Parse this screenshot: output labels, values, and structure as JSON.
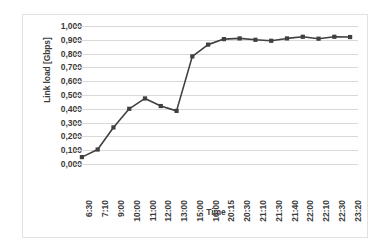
{
  "chart_data": {
    "type": "line",
    "title": "",
    "xlabel": "Time",
    "ylabel": "Link load [Gbps]",
    "ylim": [
      0,
      1.0
    ],
    "ytick_step": 0.1,
    "grid": true,
    "legend": false,
    "decimal_separator": ",",
    "marker": "square",
    "series_color": "#404040",
    "gridline_color": "#d9d9d9",
    "text_color": "#3b3b3b",
    "categories": [
      "6:30",
      "7:10",
      "9:00",
      "10:00",
      "11:00",
      "12:00",
      "13:00",
      "15:00",
      "16:00",
      "20:15",
      "20:30",
      "21:10",
      "21:30",
      "21:40",
      "22:00",
      "22:10",
      "22:30",
      "23:20"
    ],
    "ytick_labels": [
      "1,000",
      "0,900",
      "0,800",
      "0,700",
      "0,600",
      "0,500",
      "0,400",
      "0,300",
      "0,200",
      "0,100",
      "0,000"
    ],
    "ytick_values": [
      1.0,
      0.9,
      0.8,
      0.7,
      0.6,
      0.5,
      0.4,
      0.3,
      0.2,
      0.1,
      0.0
    ],
    "values": [
      0.05,
      0.105,
      0.265,
      0.4,
      0.475,
      0.42,
      0.385,
      0.78,
      0.865,
      0.905,
      0.91,
      0.9,
      0.893,
      0.91,
      0.922,
      0.908,
      0.922,
      0.92
    ]
  }
}
